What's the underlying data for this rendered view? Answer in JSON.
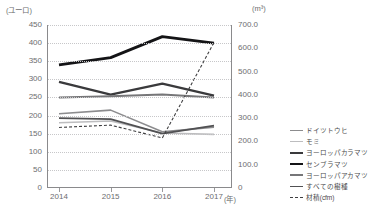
{
  "axes": {
    "left_unit": "(ユーロ)",
    "right_unit": "(m³)",
    "x_unit": "(年)",
    "left_ticks": [
      "450",
      "400",
      "350",
      "300",
      "250",
      "200",
      "150",
      "100",
      "50",
      "0"
    ],
    "right_ticks": [
      "700.0",
      "600.0",
      "500.0",
      "400.0",
      "300.0",
      "200.0",
      "100.0",
      "0"
    ],
    "x_ticks": [
      "2014",
      "2015",
      "2016",
      "2017"
    ]
  },
  "legend": {
    "items": [
      {
        "label": "ドイツトウヒ",
        "color": "#8c8c8e",
        "width": 1.6,
        "dash": "none"
      },
      {
        "label": "モミ",
        "color": "#bdbdbf",
        "width": 1.6,
        "dash": "none"
      },
      {
        "label": "ヨーロッパカラマツ",
        "color": "#3a3a3c",
        "width": 2.4,
        "dash": "none"
      },
      {
        "label": "センブラマツ",
        "color": "#141416",
        "width": 2.8,
        "dash": "none"
      },
      {
        "label": "ヨーロッパアカマツ",
        "color": "#767678",
        "width": 2.0,
        "dash": "none"
      },
      {
        "label": "すべての樹種",
        "color": "#515153",
        "width": 1.8,
        "dash": "none"
      },
      {
        "label": "材積(cfm)",
        "color": "#3f3f41",
        "width": 1.1,
        "dash": "3,2"
      }
    ]
  },
  "chart_data": {
    "type": "line",
    "title": "",
    "xlabel": "(年)",
    "ylabel": "(ユーロ)",
    "y2label": "(m³)",
    "x": [
      "2014",
      "2015",
      "2016",
      "2017"
    ],
    "ylim": [
      0,
      450
    ],
    "y2lim": [
      0,
      700
    ],
    "yticks": [
      0,
      50,
      100,
      150,
      200,
      250,
      300,
      350,
      400,
      450
    ],
    "y2ticks": [
      0,
      100,
      200,
      300,
      400,
      500,
      600,
      700
    ],
    "grid": true,
    "legend_position": "right",
    "series": [
      {
        "name": "ドイツトウヒ",
        "axis": "left",
        "values": [
          205,
          215,
          155,
          168
        ],
        "color": "#8c8c8e",
        "width": 1.6,
        "dash": "none"
      },
      {
        "name": "モミ",
        "axis": "left",
        "values": [
          180,
          185,
          152,
          148
        ],
        "color": "#bdbdbf",
        "width": 1.6,
        "dash": "none"
      },
      {
        "name": "ヨーロッパカラマツ",
        "axis": "left",
        "values": [
          293,
          258,
          288,
          255
        ],
        "color": "#3a3a3c",
        "width": 2.4,
        "dash": "none"
      },
      {
        "name": "センブラマツ",
        "axis": "left",
        "values": [
          340,
          360,
          418,
          400
        ],
        "color": "#141416",
        "width": 2.8,
        "dash": "none"
      },
      {
        "name": "ヨーロッパアカマツ",
        "axis": "left",
        "values": [
          250,
          253,
          258,
          250
        ],
        "color": "#767678",
        "width": 2.0,
        "dash": "none"
      },
      {
        "name": "すべての樹種",
        "axis": "left",
        "values": [
          193,
          190,
          150,
          172
        ],
        "color": "#515153",
        "width": 1.8,
        "dash": "none"
      },
      {
        "name": "材積(cfm)",
        "axis": "right",
        "values": [
          260,
          270,
          215,
          625
        ],
        "color": "#3f3f41",
        "width": 1.1,
        "dash": "3,2"
      }
    ]
  }
}
